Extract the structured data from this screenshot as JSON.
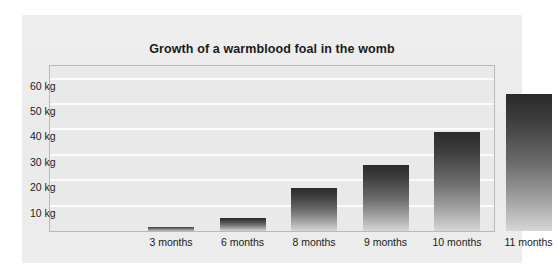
{
  "chart_data": {
    "type": "bar",
    "title": "Growth of a warmblood foal in the womb",
    "xlabel": "",
    "ylabel": "",
    "unit": "kg",
    "categories": [
      "3 months",
      "6 months",
      "8 months",
      "9 months",
      "10 months",
      "11 months"
    ],
    "values": [
      1.5,
      5,
      17,
      26,
      39,
      54
    ],
    "ylim": [
      0,
      65
    ],
    "yticks": [
      10,
      20,
      30,
      40,
      50,
      60
    ],
    "ytick_labels": [
      "10 kg",
      "20 kg",
      "30 kg",
      "40 kg",
      "50 kg",
      "60 kg"
    ],
    "grid": true,
    "legend": "none",
    "bar_color": "#3c3c3c",
    "bar_gradient_top": "#2a2a2a",
    "bar_gradient_bottom": "#d8d8d8",
    "plot_background": "#e9e9e9",
    "panel_background": "#ececec",
    "gridline_color": "#fbfbfb",
    "frame_color": "#b9b9b9"
  }
}
